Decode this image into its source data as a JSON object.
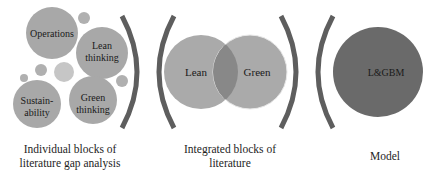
{
  "colors": {
    "block_circle": "#a8a8a8",
    "small_circle": "#b0b0b0",
    "small_circle_light": "#c6c6c6",
    "bracket": "#5e5e5e",
    "venn_circle": "#aaaaaa",
    "venn_overlap": "#888888",
    "model_circle": "#6a6a6a",
    "text": "#1a1a1a"
  },
  "section1": {
    "blocks": [
      {
        "line1": "Operations",
        "line2": ""
      },
      {
        "line1": "Lean",
        "line2": "thinking"
      },
      {
        "line1": "Sustain-",
        "line2": "ability"
      },
      {
        "line1": "Green",
        "line2": "thinking"
      }
    ],
    "caption_line1": "Individual blocks of",
    "caption_line2": "literature gap analysis"
  },
  "section2": {
    "left_circle": "Lean",
    "right_circle": "Green",
    "caption_line1": "Integrated blocks of",
    "caption_line2": "literature"
  },
  "section3": {
    "circle": "L&GBM",
    "caption": "Model"
  }
}
